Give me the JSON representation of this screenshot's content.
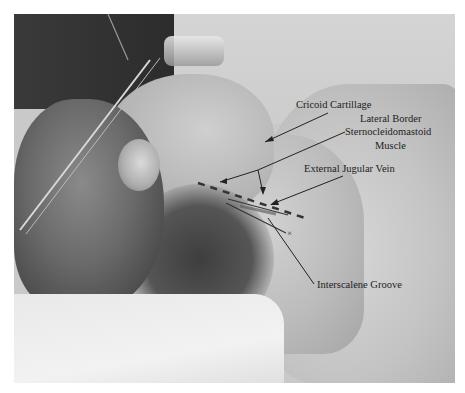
{
  "figure": {
    "labels": [
      {
        "id": "cricoid",
        "text": "Cricoid Cartillage"
      },
      {
        "id": "lateral-border",
        "text": "Lateral Border"
      },
      {
        "id": "scm",
        "text": "Sternocleidomastoid"
      },
      {
        "id": "muscle",
        "text": "Muscle"
      },
      {
        "id": "ejv",
        "text": "External Jugular Vein"
      },
      {
        "id": "interscalene",
        "text": "Interscalene Groove"
      }
    ]
  }
}
